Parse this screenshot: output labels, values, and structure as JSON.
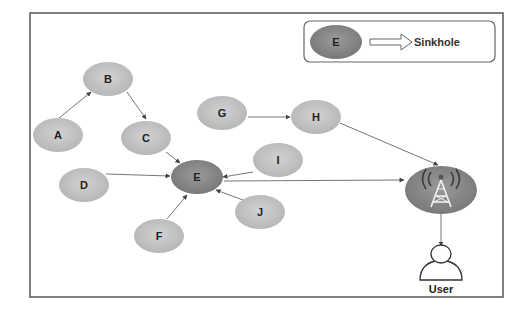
{
  "diagram": {
    "colors": {
      "frame": "#555555",
      "node_fill": "#c4c4c4",
      "sinkhole_fill": "#8a8a8a",
      "tower_fill": "#8a8a8a",
      "edge": "#777777",
      "background": "#ffffff"
    },
    "legend": {
      "node_label": "E",
      "arrow": "hollow-right-arrow",
      "label": "Sinkhole"
    },
    "nodes": [
      {
        "id": "A",
        "label": "A",
        "type": "sensor"
      },
      {
        "id": "B",
        "label": "B",
        "type": "sensor"
      },
      {
        "id": "C",
        "label": "C",
        "type": "sensor"
      },
      {
        "id": "D",
        "label": "D",
        "type": "sensor"
      },
      {
        "id": "E",
        "label": "E",
        "type": "sinkhole"
      },
      {
        "id": "F",
        "label": "F",
        "type": "sensor"
      },
      {
        "id": "G",
        "label": "G",
        "type": "sensor"
      },
      {
        "id": "H",
        "label": "H",
        "type": "sensor"
      },
      {
        "id": "I",
        "label": "I",
        "type": "sensor"
      },
      {
        "id": "J",
        "label": "J",
        "type": "sensor"
      },
      {
        "id": "BS",
        "label": "",
        "type": "base-station",
        "icon": "radio-tower-icon"
      },
      {
        "id": "U",
        "label": "User",
        "type": "user",
        "icon": "user-icon"
      }
    ],
    "edges": [
      {
        "from": "A",
        "to": "B"
      },
      {
        "from": "B",
        "to": "C"
      },
      {
        "from": "C",
        "to": "E"
      },
      {
        "from": "D",
        "to": "E"
      },
      {
        "from": "F",
        "to": "E"
      },
      {
        "from": "I",
        "to": "E"
      },
      {
        "from": "J",
        "to": "E"
      },
      {
        "from": "G",
        "to": "H"
      },
      {
        "from": "H",
        "to": "BS"
      },
      {
        "from": "E",
        "to": "BS"
      },
      {
        "from": "BS",
        "to": "U"
      }
    ]
  }
}
